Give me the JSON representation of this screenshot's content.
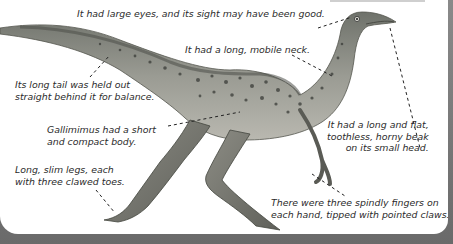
{
  "diagram": {
    "subject": "Gallimimus",
    "labels": [
      {
        "id": "eyes",
        "lines": [
          "It had large eyes, and its sight may have been good."
        ]
      },
      {
        "id": "neck",
        "lines": [
          "It had a long, mobile neck."
        ]
      },
      {
        "id": "tail",
        "lines": [
          "Its long tail was held out",
          "straight behind it for balance."
        ]
      },
      {
        "id": "body",
        "lines": [
          "Gallimimus had a short",
          "and compact body."
        ]
      },
      {
        "id": "beak",
        "lines": [
          "It had a long and flat,",
          "toothless, horny beak",
          "on its small head."
        ]
      },
      {
        "id": "legs",
        "lines": [
          "Long, slim legs, each",
          "with three clawed toes."
        ]
      },
      {
        "id": "fingers",
        "lines": [
          "There were three spindly fingers on",
          "each hand, tipped with pointed claws."
        ]
      }
    ],
    "colors": {
      "background": "#ffffff",
      "frame": "#6f6f6f",
      "text": "#2b2b2b",
      "leader_line": "#222222",
      "skin": "#8f9088",
      "spots": "#3a3c38"
    }
  }
}
